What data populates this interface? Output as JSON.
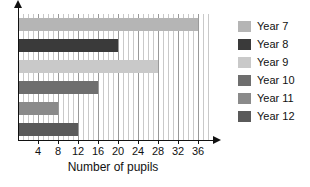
{
  "chart_data": {
    "type": "bar",
    "orientation": "horizontal",
    "title": "",
    "xlabel": "Number of pupils",
    "ylabel": "",
    "categories": [
      "Year 7",
      "Year 8",
      "Year 9",
      "Year 10",
      "Year 11",
      "Year 12"
    ],
    "values": [
      36,
      20,
      28,
      16,
      8,
      12
    ],
    "xlim": [
      0,
      38
    ],
    "xticks": [
      4,
      8,
      12,
      16,
      20,
      24,
      28,
      32,
      36
    ],
    "xtick_labels": [
      "4",
      "8",
      "12",
      "16",
      "20",
      "24",
      "28",
      "32",
      "36"
    ],
    "grid": true,
    "grid_axis": "x",
    "grid_minor_step": 1,
    "legend_position": "right",
    "legend": [
      {
        "label": "Year 7",
        "color": "#b5b5b5",
        "value": 36
      },
      {
        "label": "Year 8",
        "color": "#3a3a3a",
        "value": 20
      },
      {
        "label": "Year 9",
        "color": "#c9c9c9",
        "value": 28
      },
      {
        "label": "Year 10",
        "color": "#6e6e6e",
        "value": 16
      },
      {
        "label": "Year 11",
        "color": "#8a8a8a",
        "value": 8
      },
      {
        "label": "Year 12",
        "color": "#5a5a5a",
        "value": 12
      }
    ]
  },
  "axis": {
    "x_arrow": "arrow-right",
    "y_arrow": "arrow-up"
  }
}
